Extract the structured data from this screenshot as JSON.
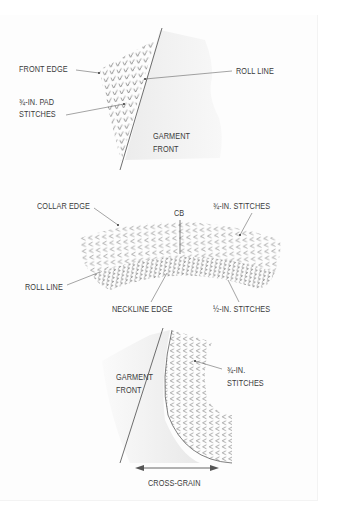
{
  "figure": {
    "panel1": {
      "title": "Pad stitching the lapel",
      "labels": {
        "front_edge": "FRONT EDGE",
        "roll_line": "ROLL LINE",
        "pad_stitches_line1": "¾-IN. PAD",
        "pad_stitches_line2": "STITCHES",
        "garment_front_line1": "GARMENT",
        "garment_front_line2": "FRONT"
      }
    },
    "panel2": {
      "title": "Pad stitching the undercollar",
      "labels": {
        "collar_edge": "COLLAR EDGE",
        "cb": "CB",
        "three_quarter_stitches": "¾-IN. STITCHES",
        "roll_line": "ROLL LINE",
        "neckline_edge": "NECKLINE EDGE",
        "half_stitches": "½-IN. STITCHES"
      }
    },
    "panel3": {
      "title": "Pad stitching the chest area",
      "labels": {
        "garment_front_line1": "GARMENT",
        "garment_front_line2": "FRONT",
        "stitches_line1": "¾-IN.",
        "stitches_line2": "STITCHES",
        "cross_grain": "CROSS-GRAIN"
      }
    },
    "colors": {
      "line": "#4a4a4a",
      "fabric_shade": "#ececec",
      "stitch": "#6a6a6a",
      "text": "#3a3a3a"
    }
  }
}
